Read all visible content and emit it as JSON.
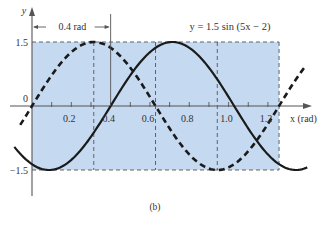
{
  "chart_data": {
    "type": "line",
    "title": "",
    "equation_label": "y = 1.5 sin (5x − 2)",
    "xlabel": "x (rad)",
    "ylabel": "y",
    "caption": "(b)",
    "phase_shift_annotation": "0.4 rad",
    "x_ticks": [
      0.1,
      0.2,
      0.3,
      0.4,
      0.5,
      0.6,
      0.7,
      0.8,
      0.9,
      1.0,
      1.1,
      1.2
    ],
    "x_tick_labels": [
      "0.2",
      "0.4",
      "0.6",
      "0.8",
      "1.0",
      "1.2"
    ],
    "x_tick_label_values": [
      0.2,
      0.4,
      0.6,
      0.8,
      1.0,
      1.2
    ],
    "y_tick_labels": [
      "1.5",
      "0",
      "−1.5"
    ],
    "y_tick_values": [
      1.5,
      0,
      -1.5
    ],
    "xlim": [
      -0.09,
      1.42
    ],
    "ylim": [
      -2.1,
      2.3
    ],
    "grid": false,
    "shaded_region": {
      "x": [
        0,
        1.2566
      ],
      "y": [
        -1.5,
        1.5
      ],
      "color": "#c5d9f1"
    },
    "dashed_guides_x": [
      0.3142,
      0.6283,
      0.9425,
      1.2566
    ],
    "phase_marker_x": 0.4,
    "series": [
      {
        "name": "y = 1.5 sin (5x − 2)",
        "style": "solid",
        "color": "#1a1a1a",
        "amplitude": 1.5,
        "frequency": 5,
        "phase": -2,
        "x_range": [
          -0.09,
          1.4
        ],
        "key_points": [
          {
            "x": 0.0857,
            "y": -1.5
          },
          {
            "x": 0.4,
            "y": 0
          },
          {
            "x": 0.7142,
            "y": 1.5
          },
          {
            "x": 1.0283,
            "y": 0
          },
          {
            "x": 1.3425,
            "y": -1.5
          }
        ]
      },
      {
        "name": "y = 1.5 sin 5x (reference)",
        "style": "dashed",
        "color": "#1a1a1a",
        "amplitude": 1.5,
        "frequency": 5,
        "phase": 0,
        "x_range": [
          -0.06,
          1.39
        ],
        "key_points": [
          {
            "x": 0,
            "y": 0
          },
          {
            "x": 0.3142,
            "y": 1.5
          },
          {
            "x": 0.6283,
            "y": 0
          },
          {
            "x": 0.9425,
            "y": -1.5
          },
          {
            "x": 1.2566,
            "y": 0
          }
        ]
      }
    ]
  },
  "colors": {
    "shade": "#c5d9f1",
    "axis": "#555555",
    "curve": "#1a1a1a",
    "guide": "#555555"
  }
}
